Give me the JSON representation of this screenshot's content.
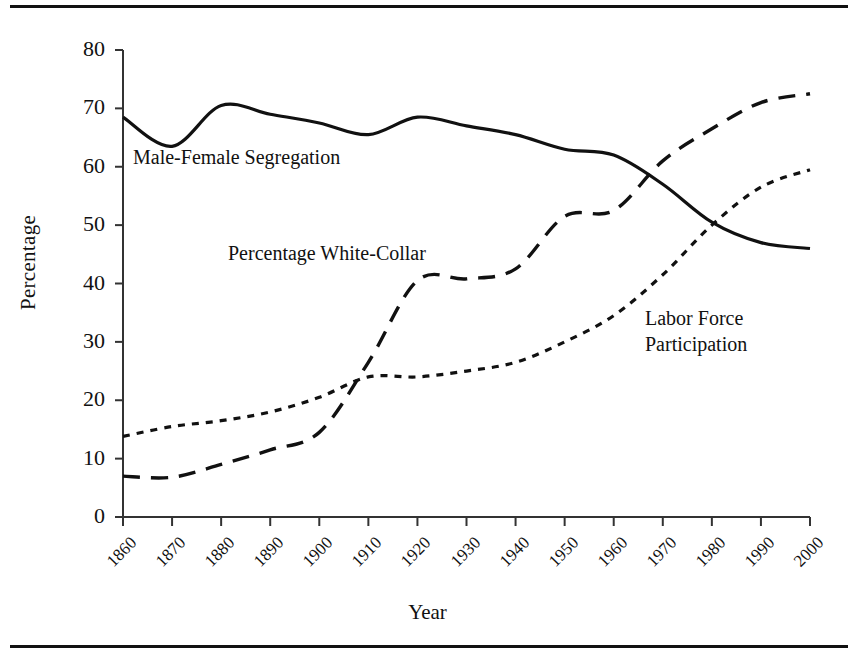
{
  "figure": {
    "ylabel": "Percentage",
    "xlabel": "Year",
    "labels": {
      "segregation": "Male-Female Segregation",
      "white_collar": "Percentage White-Collar",
      "labor_force": "Labor Force\nParticipation"
    }
  },
  "chart_data": {
    "type": "line",
    "title": "",
    "xlabel": "Year",
    "ylabel": "Percentage",
    "xlim": [
      1860,
      2000
    ],
    "ylim": [
      0,
      80
    ],
    "ytick_labels": [
      "0",
      "10",
      "20",
      "30",
      "40",
      "50",
      "60",
      "70",
      "80"
    ],
    "yticks": [
      0,
      10,
      20,
      30,
      40,
      50,
      60,
      70,
      80
    ],
    "xtick_labels": [
      "1860",
      "1870",
      "1880",
      "1890",
      "1900",
      "1910",
      "1920",
      "1930",
      "1940",
      "1950",
      "1960",
      "1970",
      "1980",
      "1990",
      "2000"
    ],
    "x": [
      1860,
      1870,
      1880,
      1890,
      1900,
      1910,
      1920,
      1930,
      1940,
      1950,
      1960,
      1970,
      1980,
      1990,
      2000
    ],
    "grid": false,
    "legend": "inline-annotations",
    "line_color": "#111111",
    "series": [
      {
        "name": "Male-Female Segregation",
        "style": "solid",
        "values": [
          68.5,
          63.5,
          70.5,
          69.0,
          67.5,
          65.5,
          68.5,
          67.0,
          65.5,
          63.0,
          62.0,
          57.0,
          50.5,
          47.0,
          46.0
        ]
      },
      {
        "name": "Percentage White-Collar",
        "style": "dashed",
        "values": [
          7.0,
          6.8,
          9.0,
          11.5,
          14.5,
          26.5,
          40.5,
          40.8,
          42.5,
          51.5,
          52.5,
          61.0,
          66.5,
          71.0,
          72.5
        ]
      },
      {
        "name": "Labor Force Participation",
        "style": "dotted",
        "values": [
          13.8,
          15.5,
          16.5,
          18.0,
          20.5,
          24.0,
          24.0,
          25.0,
          26.5,
          30.0,
          34.5,
          41.5,
          50.0,
          56.5,
          59.5
        ]
      }
    ]
  }
}
